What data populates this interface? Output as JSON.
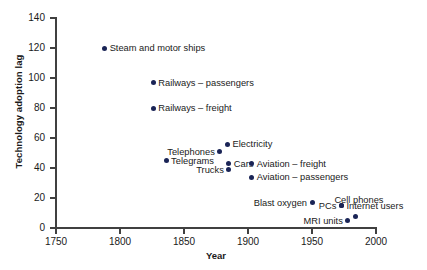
{
  "chart_data": {
    "type": "scatter",
    "title": "",
    "xlabel": "Year",
    "ylabel": "Technology adoption lag",
    "xlim": [
      1750,
      2000
    ],
    "ylim": [
      0,
      140
    ],
    "xticks": [
      1750,
      1800,
      1850,
      1900,
      1950,
      2000
    ],
    "yticks": [
      0,
      20,
      40,
      60,
      80,
      100,
      120,
      140
    ],
    "grid": false,
    "legend": "none",
    "marker_color": "#1a2456",
    "points": [
      {
        "label": "Steam and motor ships",
        "x": 1788,
        "y": 120,
        "label_side": "right"
      },
      {
        "label": "Railways – passengers",
        "x": 1826,
        "y": 97,
        "label_side": "right"
      },
      {
        "label": "Railways – freight",
        "x": 1826,
        "y": 80,
        "label_side": "right"
      },
      {
        "label": "Electricity",
        "x": 1884,
        "y": 56,
        "label_side": "right"
      },
      {
        "label": "Telephones",
        "x": 1878,
        "y": 51,
        "label_side": "left"
      },
      {
        "label": "Telegrams",
        "x": 1836,
        "y": 45,
        "label_side": "right"
      },
      {
        "label": "Cars",
        "x": 1885,
        "y": 43,
        "label_side": "right"
      },
      {
        "label": "Trucks",
        "x": 1885,
        "y": 39,
        "label_side": "left"
      },
      {
        "label": "Aviation – freight",
        "x": 1903,
        "y": 43,
        "label_side": "right"
      },
      {
        "label": "Aviation – passengers",
        "x": 1903,
        "y": 34,
        "label_side": "right"
      },
      {
        "label": "Blast oxygen",
        "x": 1950,
        "y": 17,
        "label_side": "left"
      },
      {
        "label": "PCs",
        "x": 1973,
        "y": 15,
        "label_side": "left"
      },
      {
        "label": "Internet users",
        "x": 1973,
        "y": 15,
        "label_side": "right"
      },
      {
        "label": "Cell phones",
        "x": 1984,
        "y": 8,
        "label_side": "cell"
      },
      {
        "label": "MRI units",
        "x": 1978,
        "y": 5,
        "label_side": "left"
      }
    ]
  }
}
